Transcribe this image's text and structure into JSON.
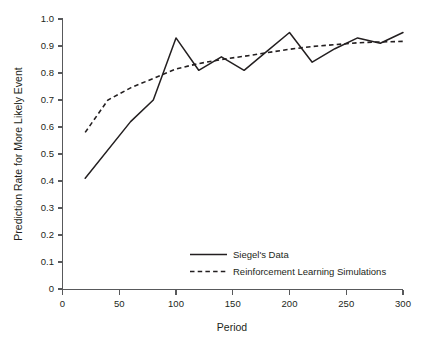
{
  "chart_data": {
    "type": "line",
    "title": "",
    "xlabel": "Period",
    "ylabel": "Prediction Rate for More Likely Event",
    "xlim": [
      0,
      300
    ],
    "ylim": [
      0,
      1.0
    ],
    "grid": false,
    "legend_position": "inside-lower-right",
    "x_ticks": [
      "0",
      "50",
      "100",
      "150",
      "200",
      "250",
      "300"
    ],
    "x_tick_values": [
      0,
      50,
      100,
      150,
      200,
      250,
      300
    ],
    "y_ticks": [
      "0",
      "0.1",
      "0.2",
      "0.3",
      "0.4",
      "0.5",
      "0.6",
      "0.7",
      "0.8",
      "0.9",
      "1.0"
    ],
    "y_tick_values": [
      0,
      0.1,
      0.2,
      0.3,
      0.4,
      0.5,
      0.6,
      0.7,
      0.8,
      0.9,
      1.0
    ],
    "series": [
      {
        "name": "Siegel's Data",
        "style": "solid",
        "color": "#231f20",
        "x": [
          20,
          60,
          80,
          100,
          120,
          140,
          160,
          180,
          200,
          220,
          240,
          260,
          280,
          300
        ],
        "values": [
          0.41,
          0.62,
          0.7,
          0.93,
          0.81,
          0.86,
          0.81,
          0.88,
          0.95,
          0.84,
          0.89,
          0.93,
          0.91,
          0.95
        ]
      },
      {
        "name": "Reinforcement Learning Simulations",
        "style": "dashed",
        "color": "#231f20",
        "x": [
          20,
          40,
          60,
          80,
          100,
          120,
          140,
          160,
          180,
          200,
          220,
          240,
          260,
          280,
          300
        ],
        "values": [
          0.58,
          0.7,
          0.745,
          0.78,
          0.815,
          0.835,
          0.85,
          0.862,
          0.875,
          0.888,
          0.898,
          0.905,
          0.912,
          0.915,
          0.917
        ]
      }
    ]
  },
  "legend": {
    "entries": [
      {
        "label": "Siegel's Data",
        "style": "solid"
      },
      {
        "label": "Reinforcement Learning Simulations",
        "style": "dashed"
      }
    ]
  },
  "colors": {
    "ink": "#231f20",
    "axis": "#58595b",
    "background": "#ffffff"
  }
}
